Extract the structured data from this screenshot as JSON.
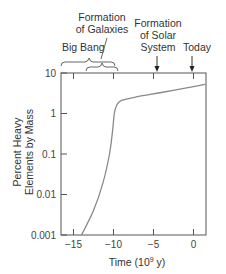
{
  "chart_data": {
    "type": "line",
    "title": "",
    "xlabel": "Time (10⁹ y)",
    "xlabel_parts": {
      "base": "Time (10",
      "sup": "9",
      "rest": " y)"
    },
    "ylabel_lines": [
      "Percent Heavy",
      "Elements by Mass"
    ],
    "ylabel": "Percent Heavy Elements by Mass",
    "yscale": "log",
    "ylim": [
      0.001,
      10
    ],
    "xlim": [
      -16.5,
      1.5
    ],
    "x_ticks": [
      -15,
      -10,
      -5,
      0
    ],
    "x_tick_labels": [
      "−15",
      "−10",
      "−5",
      "0"
    ],
    "y_ticks": [
      10,
      1,
      0.1,
      0.01,
      0.001
    ],
    "y_tick_labels": [
      "10",
      "1",
      "0.1",
      "0.01",
      "0.001"
    ],
    "grid": false,
    "series": [
      {
        "name": "Percent heavy elements",
        "color": "#8a8a8a",
        "x": [
          -14,
          -12.5,
          -11.3,
          -10.5,
          -10.1,
          -9.9,
          -9.6,
          -9,
          -7,
          -4,
          0,
          1.5
        ],
        "y": [
          0.001,
          0.004,
          0.02,
          0.1,
          0.4,
          1,
          1.6,
          2.1,
          2.6,
          3.3,
          4.6,
          5.3
        ]
      }
    ],
    "annotations": [
      {
        "label_lines": [
          "Big Bang"
        ],
        "type": "brace",
        "x_range": [
          -16.5,
          -12.8
        ]
      },
      {
        "label_lines": [
          "Formation",
          "of Galaxies"
        ],
        "type": "brace",
        "x_range": [
          -13,
          -9.3
        ]
      },
      {
        "label_lines": [
          "Formation",
          "of Solar",
          "System"
        ],
        "type": "arrow",
        "x": -4.6
      },
      {
        "label_lines": [
          "Today"
        ],
        "type": "arrow",
        "x": 0
      }
    ]
  }
}
